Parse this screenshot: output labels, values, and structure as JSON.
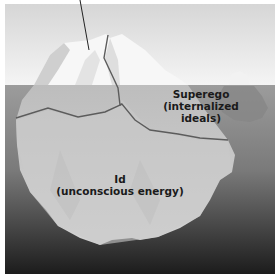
{
  "diagram": {
    "title": "",
    "labels": {
      "superego": {
        "line1": "Superego",
        "line2": "(internalized",
        "line3": "ideals)"
      },
      "id": {
        "line1": "Id",
        "line2": "(unconscious energy)"
      }
    },
    "colors": {
      "sky_top": "#d9d9d9",
      "sky_bottom": "#f4f4f4",
      "water_top": "#9b9b9b",
      "water_bottom": "#1e1e1e",
      "ice_light": "#f7f7f7",
      "ice_underwater": "#c4c4c4",
      "divider_line": "#5a5a5a",
      "pointer_line": "#222222"
    }
  }
}
